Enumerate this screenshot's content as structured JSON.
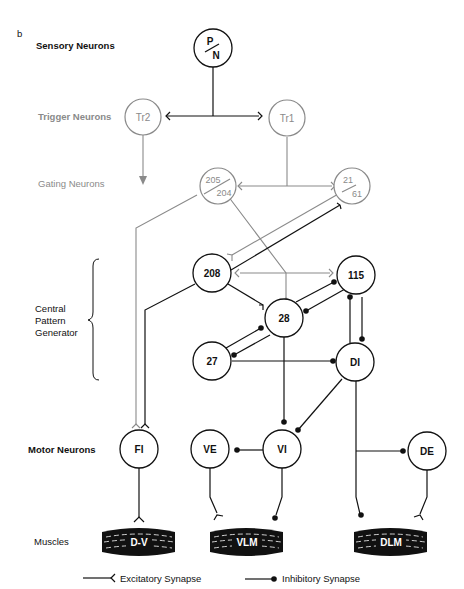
{
  "panel_label": "b",
  "row_labels": {
    "sensory": "Sensory Neurons",
    "trigger": "Trigger Neurons",
    "gating": "Gating Neurons",
    "cpg_line1": "Central",
    "cpg_line2": "Pattern",
    "cpg_line3": "Generator",
    "motor": "Motor Neurons",
    "muscles": "Muscles"
  },
  "neurons": {
    "pn_top": "P",
    "pn_bottom": "N",
    "tr2": "Tr2",
    "tr1": "Tr1",
    "g205": "205",
    "g204": "204",
    "g21": "21",
    "g61": "61",
    "n208": "208",
    "n115": "115",
    "n28": "28",
    "n27": "27",
    "di": "DI",
    "fi": "FI",
    "ve": "VE",
    "vi": "VI",
    "de": "DE"
  },
  "muscles": {
    "dv": "D-V",
    "vlm": "VLM",
    "dlm": "DLM"
  },
  "legend": {
    "excitatory": "Excitatory Synapse",
    "inhibitory": "Inhibitory Synapse"
  },
  "colors": {
    "primary": "#111111",
    "secondary_gray": "#8a8a8a"
  }
}
